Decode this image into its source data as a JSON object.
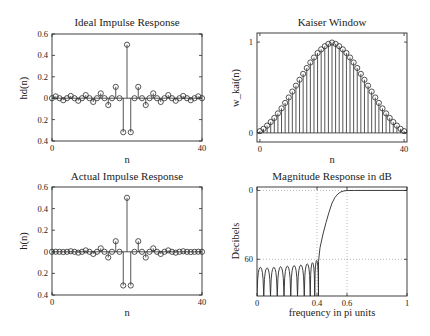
{
  "figure": {
    "background": "#ffffff",
    "line_color": "#2a2a2a",
    "grid_color": "#9a9a9a"
  },
  "chart_data": [
    {
      "id": "ideal",
      "type": "stem",
      "title": "Ideal Impulse Response",
      "xlabel": "n",
      "ylabel": "hd(n)",
      "xlim": [
        0,
        40
      ],
      "ylim": [
        -0.4,
        0.6
      ],
      "xticks": [
        0,
        40
      ],
      "xtick_labels": [
        "0",
        "40"
      ],
      "yticks": [
        0.6,
        0.4,
        0.2,
        0,
        -0.2,
        -0.4
      ],
      "ytick_labels": [
        "0.6",
        "0.4",
        "0.2",
        "0",
        "0.2",
        "0.4"
      ],
      "grid": false,
      "box": {
        "x": 52,
        "y": 34,
        "w": 150,
        "h": 107
      },
      "x": [
        0,
        1,
        2,
        3,
        4,
        5,
        6,
        7,
        8,
        9,
        10,
        11,
        12,
        13,
        14,
        15,
        16,
        17,
        18,
        19,
        20,
        21,
        22,
        23,
        24,
        25,
        26,
        27,
        28,
        29,
        30,
        31,
        32,
        33,
        34,
        35,
        36,
        37,
        38,
        39,
        40
      ],
      "values": [
        0,
        0.017,
        0,
        -0.019,
        0,
        0.021,
        0,
        -0.024,
        0,
        0.029,
        0,
        -0.035,
        0,
        0.045,
        0,
        -0.064,
        0,
        0.106,
        0,
        -0.318,
        0.5,
        -0.318,
        0,
        0.106,
        0,
        -0.064,
        0,
        0.045,
        0,
        -0.035,
        0,
        0.029,
        0,
        -0.024,
        0,
        0.021,
        0,
        -0.019,
        0,
        0.017,
        0
      ]
    },
    {
      "id": "kaiser",
      "type": "stem",
      "title": "Kaiser Window",
      "xlabel": "n",
      "ylabel": "w_kai(n)",
      "xlim": [
        -0.8,
        40.8
      ],
      "ylim": [
        -0.1,
        1.1
      ],
      "xticks": [
        0,
        40
      ],
      "xtick_labels": [
        "0",
        "40"
      ],
      "yticks": [
        0,
        1
      ],
      "ytick_labels": [
        "0",
        "1"
      ],
      "grid": false,
      "box": {
        "x": 257,
        "y": 33,
        "w": 150,
        "h": 109
      },
      "x": [
        0,
        1,
        2,
        3,
        4,
        5,
        6,
        7,
        8,
        9,
        10,
        11,
        12,
        13,
        14,
        15,
        16,
        17,
        18,
        19,
        20,
        21,
        22,
        23,
        24,
        25,
        26,
        27,
        28,
        29,
        30,
        31,
        32,
        33,
        34,
        35,
        36,
        37,
        38,
        39,
        40
      ],
      "values": [
        0.02,
        0.045,
        0.08,
        0.12,
        0.165,
        0.215,
        0.27,
        0.33,
        0.39,
        0.455,
        0.52,
        0.585,
        0.65,
        0.715,
        0.775,
        0.83,
        0.88,
        0.92,
        0.955,
        0.98,
        0.995,
        0.98,
        0.955,
        0.92,
        0.88,
        0.83,
        0.775,
        0.715,
        0.65,
        0.585,
        0.52,
        0.455,
        0.39,
        0.33,
        0.27,
        0.215,
        0.165,
        0.12,
        0.08,
        0.045,
        0.02
      ]
    },
    {
      "id": "actual",
      "type": "stem",
      "title": "Actual Impulse Response",
      "xlabel": "n",
      "ylabel": "h(n)",
      "xlim": [
        0,
        40
      ],
      "ylim": [
        -0.4,
        0.6
      ],
      "xticks": [
        0,
        40
      ],
      "xtick_labels": [
        "0",
        "40"
      ],
      "yticks": [
        0.6,
        0.4,
        0.2,
        0,
        -0.2,
        -0.4
      ],
      "ytick_labels": [
        "0.6",
        "0.4",
        "0.2",
        "0",
        "0.2",
        "0.4"
      ],
      "grid": false,
      "box": {
        "x": 52,
        "y": 187,
        "w": 150,
        "h": 108
      },
      "x": [
        0,
        1,
        2,
        3,
        4,
        5,
        6,
        7,
        8,
        9,
        10,
        11,
        12,
        13,
        14,
        15,
        16,
        17,
        18,
        19,
        20,
        21,
        22,
        23,
        24,
        25,
        26,
        27,
        28,
        29,
        30,
        31,
        32,
        33,
        34,
        35,
        36,
        37,
        38,
        39,
        40
      ],
      "values": [
        0,
        0.001,
        0,
        -0.002,
        0,
        0.005,
        0,
        -0.008,
        0,
        0.013,
        0,
        -0.02,
        0,
        0.032,
        0,
        -0.053,
        0,
        0.098,
        0,
        -0.312,
        0.5,
        -0.312,
        0,
        0.098,
        0,
        -0.053,
        0,
        0.032,
        0,
        -0.02,
        0,
        0.013,
        0,
        -0.008,
        0,
        0.005,
        0,
        -0.002,
        0,
        0.001,
        0
      ]
    },
    {
      "id": "magnitude",
      "type": "line",
      "title": "Magnitude Response in dB",
      "xlabel": "frequency in pi units",
      "ylabel": "Decibels",
      "xlim": [
        0,
        1
      ],
      "ylim": [
        -92,
        3
      ],
      "xticks": [
        0,
        0.4,
        0.6,
        1
      ],
      "xtick_labels": [
        "0",
        "0.4",
        "0.6",
        "1"
      ],
      "yticks": [
        0,
        -60
      ],
      "ytick_labels": [
        "0",
        "60"
      ],
      "grid": true,
      "grid_x": [
        0.4,
        0.6
      ],
      "grid_y": [
        0,
        -60
      ],
      "box": {
        "x": 257,
        "y": 187,
        "w": 150,
        "h": 109
      },
      "passband_edge": 0.6,
      "stopband_edge": 0.4,
      "stopband_attenuation_db": -60,
      "sidelobe_peaks_db": [
        -67,
        -67.5,
        -67,
        -66.5,
        -66,
        -65.5,
        -65,
        -64,
        -63,
        -61
      ],
      "sidelobe_nulls": [
        0.0,
        0.045,
        0.09,
        0.135,
        0.18,
        0.225,
        0.27,
        0.315,
        0.355,
        0.385,
        0.41
      ],
      "transition": [
        [
          0.41,
          -62
        ],
        [
          0.42,
          -50
        ],
        [
          0.44,
          -38
        ],
        [
          0.46,
          -28
        ],
        [
          0.48,
          -19
        ],
        [
          0.5,
          -11
        ],
        [
          0.52,
          -6
        ],
        [
          0.54,
          -3
        ],
        [
          0.56,
          -1.2
        ],
        [
          0.58,
          -0.4
        ],
        [
          0.6,
          -0.1
        ],
        [
          0.65,
          0
        ],
        [
          1.0,
          0
        ]
      ]
    }
  ]
}
